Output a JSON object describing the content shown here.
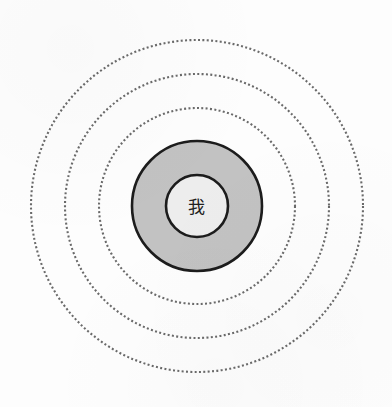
{
  "figure": {
    "type": "concentric-circles-diagram",
    "background_color": "#fdfdfd",
    "width": 392,
    "height": 407,
    "center": {
      "x": 197,
      "y": 206
    }
  },
  "core": {
    "label": "我",
    "label_color": "#202020",
    "fill_color": "#ededed",
    "stroke_color": "#1c1c1c",
    "radius": 31
  },
  "band": {
    "fill_color": "#c2c2c2",
    "stroke_color": "#1c1c1c",
    "radius": 65
  },
  "rings": [
    {
      "name": "ring-inner-dotted",
      "radius": 98,
      "style": "dotted",
      "stroke_color": "#6a6a6a"
    },
    {
      "name": "ring-middle-dotted",
      "radius": 132,
      "style": "dotted",
      "stroke_color": "#6a6a6a"
    },
    {
      "name": "ring-outer-dotted",
      "radius": 166,
      "style": "dotted",
      "stroke_color": "#6a6a6a"
    }
  ],
  "chart_data": {
    "type": "pie",
    "title": "",
    "xlabel": "",
    "ylabel": "",
    "categories": [
      "我",
      "band-ring",
      "ring-inner-dotted",
      "ring-middle-dotted",
      "ring-outer-dotted"
    ],
    "values": [
      31,
      65,
      98,
      132,
      166
    ],
    "series": [
      {
        "name": "radius_px",
        "values": [
          31,
          65,
          98,
          132,
          166
        ]
      }
    ],
    "annotations": [
      "我"
    ],
    "legend": "none",
    "grid": false
  }
}
